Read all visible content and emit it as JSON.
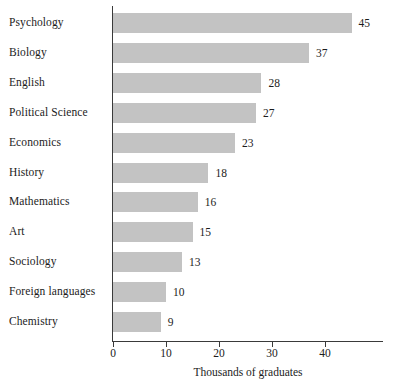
{
  "chart_data": {
    "type": "bar",
    "orientation": "horizontal",
    "title": "",
    "xlabel": "Thousands of graduates",
    "ylabel": "",
    "categories": [
      "Psychology",
      "Biology",
      "English",
      "Political Science",
      "Economics",
      "History",
      "Mathematics",
      "Art",
      "Sociology",
      "Foreign languages",
      "Chemistry"
    ],
    "values": [
      45,
      37,
      28,
      27,
      23,
      18,
      16,
      15,
      13,
      10,
      9
    ],
    "value_labels": [
      "45",
      "37",
      "28",
      "27",
      "23",
      "18",
      "16",
      "15",
      "13",
      "10",
      "9"
    ],
    "xlim": [
      0,
      47
    ],
    "xticks": [
      0,
      10,
      20,
      30,
      40
    ],
    "xtick_labels": [
      "0",
      "10",
      "20",
      "30",
      "40"
    ],
    "grid": false,
    "legend": false,
    "bar_color": "#c3c3c3",
    "axis_color": "#3a3a3a",
    "text_color": "#1c1c1c",
    "background": "#ffffff"
  }
}
